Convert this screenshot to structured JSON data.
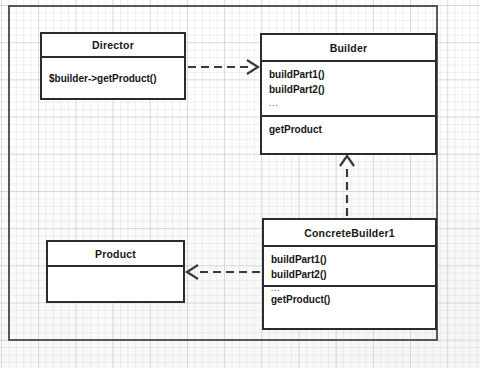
{
  "diagram": {
    "kind": "uml-class-diagram",
    "pattern_title": "Builder",
    "classes": [
      {
        "id": "director",
        "name": "Director",
        "compartments": [
          {
            "id": "operations",
            "rows": [
              "$builder->getProduct()"
            ]
          }
        ]
      },
      {
        "id": "builder",
        "name": "Builder",
        "compartments": [
          {
            "id": "methods",
            "rows": [
              "buildPart1()",
              "buildPart2()",
              "..."
            ]
          },
          {
            "id": "getter",
            "rows": [
              "getProduct"
            ]
          }
        ]
      },
      {
        "id": "concrete_builder_1",
        "name": "ConcreteBuilder1",
        "compartments": [
          {
            "id": "methods",
            "rows": [
              "buildPart1()",
              "buildPart2()",
              "..."
            ]
          },
          {
            "id": "getter",
            "rows": [
              "getProduct()"
            ]
          }
        ]
      },
      {
        "id": "product",
        "name": "Product",
        "compartments": [
          {
            "id": "body",
            "rows": []
          }
        ]
      }
    ],
    "relationships": [
      {
        "id": "director-uses-builder",
        "from": "director",
        "to": "builder",
        "type": "dependency",
        "line": "dashed",
        "arrowhead": "open",
        "direction": "right"
      },
      {
        "id": "concrete-implements-builder",
        "from": "concrete_builder_1",
        "to": "builder",
        "type": "realization",
        "line": "dashed",
        "arrowhead": "open",
        "direction": "up"
      },
      {
        "id": "concrete-creates-product",
        "from": "concrete_builder_1",
        "to": "product",
        "type": "dependency",
        "line": "dashed",
        "arrowhead": "open",
        "direction": "left"
      }
    ],
    "style": {
      "box_border_color": "#2b2b2b",
      "box_fill_color": "#ffffff",
      "text_color": "#151515",
      "edge_color": "#3a3a3a",
      "frame_border_color": "#575757",
      "grid_line_color": "#a0aab9",
      "background_color": "#ffffff"
    }
  }
}
